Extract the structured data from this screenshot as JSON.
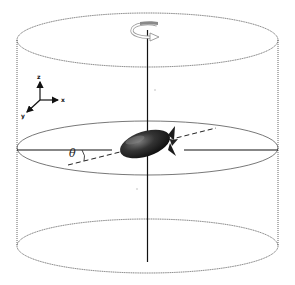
{
  "figure": {
    "angle_label": "θ",
    "axes": {
      "z": "z",
      "x": "x",
      "y": "y"
    },
    "colors": {
      "outline": "#555555",
      "axis": "#111111",
      "airship_dark": "#1a1a1a",
      "airship_light": "#6a6a6a",
      "rotation_arrow": "#9a9a9a"
    }
  }
}
